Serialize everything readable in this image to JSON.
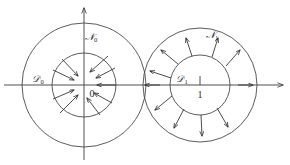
{
  "figure": {
    "background_color": "#ffffff",
    "stroke_color": "#3a3a3a",
    "width": 290,
    "height": 165
  },
  "axes": {
    "x_axis": {
      "name": "horizontal-axis",
      "y": 85,
      "x_start": 4,
      "x_end": 283,
      "arrow_at": "right"
    },
    "y_axis": {
      "name": "vertical-axis",
      "x": 84,
      "y_start": 160,
      "y_end": 8,
      "arrow_at": "top"
    },
    "origin_label": "0",
    "origin_label_x": 91,
    "origin_label_y": 96
  },
  "systems": [
    {
      "id": "left",
      "center_x": 84,
      "center_y": 85,
      "inner_radius": 32,
      "outer_radius": 62,
      "flow_direction": "inward",
      "inner_label": "ℰ",
      "inner_label_sub": "0",
      "inner_label_x": 38,
      "inner_label_y": 82,
      "annulus_label": "𝒩",
      "annulus_label_sub": "0",
      "annulus_label_x": 91,
      "annulus_label_y": 40,
      "tick_label": "",
      "arrow_count": 6
    },
    {
      "id": "right",
      "center_x": 200,
      "center_y": 85,
      "inner_radius": 30,
      "outer_radius": 57,
      "flow_direction": "outward",
      "inner_label": "ℰ",
      "inner_label_sub": "1",
      "inner_label_x": 182,
      "inner_label_y": 82,
      "annulus_label": "𝒩",
      "annulus_label_sub": "1",
      "annulus_label_x": 212,
      "annulus_label_y": 38,
      "tick_label": "1",
      "tick_label_x": 200,
      "tick_label_y": 97,
      "tick_x": 200,
      "tick_y_top": 76,
      "tick_y_bottom": 85,
      "arrow_count": 8
    }
  ],
  "labels": {
    "left_domain": "D0",
    "left_annulus": "N0",
    "right_domain": "D1",
    "right_annulus": "N1",
    "origin": "0",
    "unit_tick": "1"
  }
}
